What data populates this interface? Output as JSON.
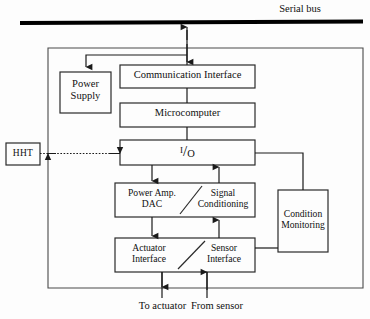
{
  "diagram": {
    "bus": {
      "label": "Serial bus",
      "color": "#000000"
    },
    "blocks": [
      {
        "id": "power-supply",
        "label": "Power\nSupply"
      },
      {
        "id": "communication-interface",
        "label": "Communication Interface"
      },
      {
        "id": "microcomputer",
        "label": "Microcomputer"
      },
      {
        "id": "io",
        "label": "I/O",
        "parts": {
          "i": "I",
          "slash": "/",
          "o": "O"
        }
      },
      {
        "id": "power-amp-dac",
        "label": "Power Amp.\nDAC"
      },
      {
        "id": "signal-conditioning",
        "label": "Signal\nConditioning"
      },
      {
        "id": "actuator-interface",
        "label": "Actuator\nInterface"
      },
      {
        "id": "sensor-interface",
        "label": "Sensor\nInterface"
      },
      {
        "id": "condition-monitoring",
        "label": "Condition\nMonitoring"
      },
      {
        "id": "hht",
        "label": "HHT"
      }
    ],
    "edge_labels": [
      {
        "id": "to-actuator",
        "label": "To actuator"
      },
      {
        "id": "from-sensor",
        "label": "From sensor"
      }
    ],
    "colors": {
      "line": "#1a1a1a",
      "box_stroke": "#2a2a2a",
      "background": "#fdfdfd",
      "text": "#101010"
    }
  }
}
